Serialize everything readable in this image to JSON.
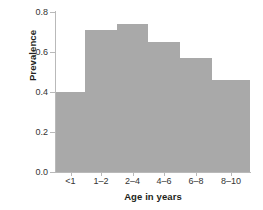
{
  "chart_data": {
    "type": "bar",
    "title": "",
    "subtitle": "",
    "xlabel": "Age in years",
    "ylabel": "Prevalence",
    "categories": [
      "<1",
      "1–2",
      "2–4",
      "4–6",
      "6–8",
      "8–10"
    ],
    "values": [
      0.4,
      0.71,
      0.74,
      0.65,
      0.57,
      0.46
    ],
    "ylim": [
      0.0,
      0.8
    ],
    "yticks": [
      "0.0",
      "0.2",
      "0.4",
      "0.6",
      "0.8"
    ],
    "ytick_values": [
      0.0,
      0.2,
      0.4,
      0.6,
      0.8
    ],
    "bar_edges": [
      0,
      29,
      61,
      92,
      124,
      156,
      194
    ],
    "grid": false,
    "legend": false,
    "bar_color": "#a9a9a9",
    "axis_color": "#b9b9b9",
    "text_color": "#333333",
    "label_color": "#231f20"
  }
}
